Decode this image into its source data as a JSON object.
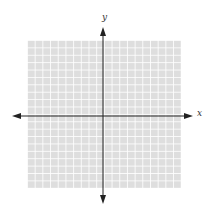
{
  "diagram": {
    "type": "coordinate-plane",
    "axes": {
      "x_label": "x",
      "y_label": "y",
      "arrows": "both-ends"
    },
    "grid": {
      "columns": 20,
      "rows": 20,
      "fill_color": "#dedede",
      "line_color": "#ffffff"
    },
    "axis_color": "#222222"
  }
}
